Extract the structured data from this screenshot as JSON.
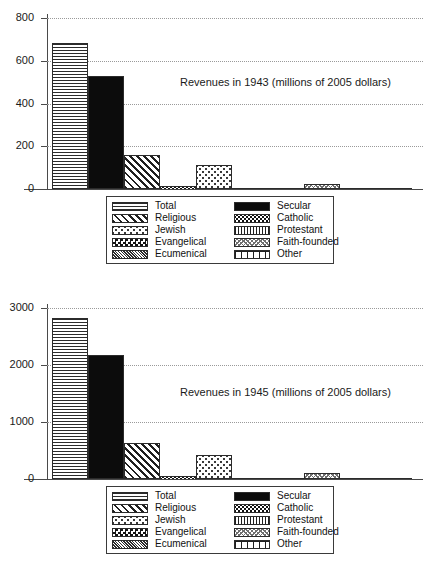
{
  "chart_data": [
    {
      "type": "bar",
      "title": "Revenues in 1943 (millions of 2005 dollars)",
      "xlabel": "",
      "ylabel": "",
      "ylim": [
        0,
        800
      ],
      "yticks": [
        0,
        200,
        400,
        600,
        800
      ],
      "grid": true,
      "legend_position": "below-axes",
      "categories": [
        "Total",
        "Secular",
        "Religious",
        "Catholic",
        "Jewish",
        "Protestant",
        "Evangelical",
        "Faith-founded",
        "Ecumenical",
        "Other"
      ],
      "values": [
        685,
        528,
        160,
        12,
        113,
        2,
        1,
        22,
        1,
        5
      ]
    },
    {
      "type": "bar",
      "title": "Revenues in 1945 (millions of 2005 dollars)",
      "xlabel": "",
      "ylabel": "",
      "ylim": [
        0,
        3000
      ],
      "yticks": [
        0,
        1000,
        2000,
        3000
      ],
      "grid": true,
      "legend_position": "below-axes",
      "categories": [
        "Total",
        "Secular",
        "Religious",
        "Catholic",
        "Jewish",
        "Protestant",
        "Evangelical",
        "Faith-founded",
        "Ecumenical",
        "Other"
      ],
      "values": [
        2820,
        2180,
        625,
        45,
        420,
        15,
        8,
        105,
        6,
        20
      ]
    }
  ],
  "charts": [
    {
      "id": "chart-1943",
      "title": "Revenues in 1943 (millions of 2005 dollars)",
      "ytick_labels": [
        "800",
        "600",
        "400",
        "200",
        "0"
      ],
      "bars": [
        {
          "name": "total",
          "label": "Total",
          "value": 685,
          "pattern": "pat-total"
        },
        {
          "name": "secular",
          "label": "Secular",
          "value": 528,
          "pattern": "pat-secular"
        },
        {
          "name": "religious",
          "label": "Religious",
          "value": 160,
          "pattern": "pat-religious"
        },
        {
          "name": "catholic",
          "label": "Catholic",
          "value": 12,
          "pattern": "pat-catholic"
        },
        {
          "name": "jewish",
          "label": "Jewish",
          "value": 113,
          "pattern": "pat-jewish"
        },
        {
          "name": "protestant",
          "label": "Protestant",
          "value": 2,
          "pattern": "pat-protestant"
        },
        {
          "name": "evangelical",
          "label": "Evangelical",
          "value": 1,
          "pattern": "pat-evangelical"
        },
        {
          "name": "faith-founded",
          "label": "Faith-founded",
          "value": 22,
          "pattern": "pat-faith"
        },
        {
          "name": "ecumenical",
          "label": "Ecumenical",
          "value": 1,
          "pattern": "pat-ecumenical"
        },
        {
          "name": "other",
          "label": "Other",
          "value": 5,
          "pattern": "pat-other"
        }
      ]
    },
    {
      "id": "chart-1945",
      "title": "Revenues in 1945 (millions of 2005 dollars)",
      "ytick_labels": [
        "3000",
        "2000",
        "1000",
        "0"
      ],
      "bars": [
        {
          "name": "total",
          "label": "Total",
          "value": 2820,
          "pattern": "pat-total"
        },
        {
          "name": "secular",
          "label": "Secular",
          "value": 2180,
          "pattern": "pat-secular"
        },
        {
          "name": "religious",
          "label": "Religious",
          "value": 625,
          "pattern": "pat-religious"
        },
        {
          "name": "catholic",
          "label": "Catholic",
          "value": 45,
          "pattern": "pat-catholic"
        },
        {
          "name": "jewish",
          "label": "Jewish",
          "value": 420,
          "pattern": "pat-jewish"
        },
        {
          "name": "protestant",
          "label": "Protestant",
          "value": 15,
          "pattern": "pat-protestant"
        },
        {
          "name": "evangelical",
          "label": "Evangelical",
          "value": 8,
          "pattern": "pat-evangelical"
        },
        {
          "name": "faith-founded",
          "label": "Faith-founded",
          "value": 105,
          "pattern": "pat-faith"
        },
        {
          "name": "ecumenical",
          "label": "Ecumenical",
          "value": 6,
          "pattern": "pat-ecumenical"
        },
        {
          "name": "other",
          "label": "Other",
          "value": 20,
          "pattern": "pat-other"
        }
      ]
    }
  ],
  "legend": {
    "rows": [
      {
        "left_label": "Total",
        "left_pattern": "pat-total",
        "right_label": "Secular",
        "right_pattern": "pat-secular"
      },
      {
        "left_label": "Religious",
        "left_pattern": "pat-religious",
        "right_label": "Catholic",
        "right_pattern": "pat-catholic"
      },
      {
        "left_label": "Jewish",
        "left_pattern": "pat-jewish",
        "right_label": "Protestant",
        "right_pattern": "pat-protestant"
      },
      {
        "left_label": "Evangelical",
        "left_pattern": "pat-evangelical",
        "right_label": "Faith-founded",
        "right_pattern": "pat-faith"
      },
      {
        "left_label": "Ecumenical",
        "left_pattern": "pat-ecumenical",
        "right_label": "Other",
        "right_pattern": "pat-other"
      }
    ]
  },
  "colors": {
    "axis": "#4a4a4a",
    "grid": "#9a9a9a",
    "ink": "#1a1a1a",
    "background": "#ffffff",
    "solid_fill": "#0c0c0c"
  }
}
